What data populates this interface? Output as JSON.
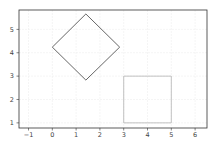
{
  "chart_data": {
    "type": "line",
    "title": "",
    "xlabel": "",
    "ylabel": "",
    "xlim": [
      -1.4,
      6.5
    ],
    "ylim": [
      0.78,
      5.83
    ],
    "grid": true,
    "legend": null,
    "x_ticks": [
      -1,
      0,
      1,
      2,
      3,
      4,
      5,
      6
    ],
    "y_ticks": [
      1,
      2,
      3,
      4,
      5
    ],
    "series": [
      {
        "name": "rotated square",
        "closed": true,
        "color": "#555555",
        "points": [
          [
            0,
            4.24
          ],
          [
            1.41,
            5.66
          ],
          [
            2.83,
            4.24
          ],
          [
            1.41,
            2.83
          ],
          [
            0,
            4.24
          ]
        ]
      },
      {
        "name": "square",
        "closed": true,
        "color": "#bbbbbb",
        "points": [
          [
            3,
            1
          ],
          [
            5,
            1
          ],
          [
            5,
            3
          ],
          [
            3,
            3
          ],
          [
            3,
            1
          ]
        ]
      }
    ]
  },
  "colors": {
    "axes": "#333333",
    "grid": "#eeeeee",
    "background": "#ffffff"
  }
}
